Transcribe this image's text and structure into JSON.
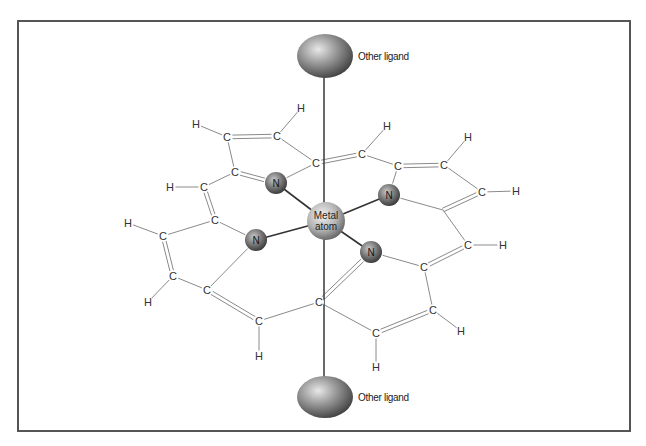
{
  "diagram": {
    "frame": {
      "x1": 18,
      "y1": 21,
      "x2": 630,
      "y2": 431,
      "color": "#555555"
    },
    "colors": {
      "bond": "#8a8a8a",
      "axis": "#444444",
      "metal_bond": "#333333",
      "sphere_light": "#e8e8e8",
      "sphere_dark": "#4a4a4a"
    },
    "axis": {
      "x": 324,
      "y1": 60,
      "y2": 395
    },
    "ligands": [
      {
        "id": "top",
        "cx": 325,
        "cy": 56,
        "rx": 28,
        "ry": 22,
        "label": "Other ligand",
        "label_x": 358,
        "label_y": 60
      },
      {
        "id": "bottom",
        "cx": 325,
        "cy": 397,
        "rx": 28,
        "ry": 21,
        "label": "Other ligand",
        "label_x": 358,
        "label_y": 401
      }
    ],
    "metal": {
      "cx": 326,
      "cy": 221,
      "r": 19,
      "label_line1": "Metal",
      "label_line2": "atom"
    },
    "nitrogens": [
      {
        "id": "N1",
        "cx": 276,
        "cy": 183,
        "r": 11,
        "label": "N"
      },
      {
        "id": "N2",
        "cx": 389,
        "cy": 195,
        "r": 11,
        "label": "N"
      },
      {
        "id": "N3",
        "cx": 256,
        "cy": 240,
        "r": 11,
        "label": "N"
      },
      {
        "id": "N4",
        "cx": 371,
        "cy": 252,
        "r": 11,
        "label": "N"
      }
    ],
    "atoms": [
      {
        "id": "H1",
        "x": 196,
        "y": 124,
        "label": "H"
      },
      {
        "id": "C1",
        "x": 227,
        "y": 137,
        "label": "C"
      },
      {
        "id": "C2",
        "x": 277,
        "y": 136,
        "label": "C"
      },
      {
        "id": "H2",
        "x": 301,
        "y": 108,
        "label": "H"
      },
      {
        "id": "C3",
        "x": 316,
        "y": 163,
        "label": "C"
      },
      {
        "id": "C4",
        "x": 235,
        "y": 172,
        "label": "C"
      },
      {
        "id": "H3",
        "x": 170,
        "y": 187,
        "label": "H"
      },
      {
        "id": "C5",
        "x": 204,
        "y": 187,
        "label": "C"
      },
      {
        "id": "C6",
        "x": 215,
        "y": 220,
        "label": "C"
      },
      {
        "id": "H4",
        "x": 128,
        "y": 223,
        "label": "H"
      },
      {
        "id": "C7",
        "x": 163,
        "y": 236,
        "label": "C"
      },
      {
        "id": "C8",
        "x": 173,
        "y": 276,
        "label": "C"
      },
      {
        "id": "H5",
        "x": 148,
        "y": 302,
        "label": "H"
      },
      {
        "id": "C9",
        "x": 207,
        "y": 290,
        "label": "C"
      },
      {
        "id": "C10",
        "x": 259,
        "y": 321,
        "label": "C"
      },
      {
        "id": "H6",
        "x": 259,
        "y": 356,
        "label": "H"
      },
      {
        "id": "C11",
        "x": 319,
        "y": 302,
        "label": "C"
      },
      {
        "id": "C12",
        "x": 376,
        "y": 333,
        "label": "C"
      },
      {
        "id": "H7",
        "x": 376,
        "y": 367,
        "label": "H"
      },
      {
        "id": "C13",
        "x": 433,
        "y": 310,
        "label": "C"
      },
      {
        "id": "H8",
        "x": 461,
        "y": 331,
        "label": "H"
      },
      {
        "id": "C14",
        "x": 424,
        "y": 267,
        "label": "C"
      },
      {
        "id": "C15",
        "x": 468,
        "y": 245,
        "label": "C"
      },
      {
        "id": "H9",
        "x": 503,
        "y": 245,
        "label": "H"
      },
      {
        "id": "C16",
        "x": 482,
        "y": 192,
        "label": "C"
      },
      {
        "id": "H10",
        "x": 516,
        "y": 191,
        "label": "H"
      },
      {
        "id": "C17",
        "x": 444,
        "y": 165,
        "label": "C"
      },
      {
        "id": "H11",
        "x": 468,
        "y": 137,
        "label": "H"
      },
      {
        "id": "C18",
        "x": 398,
        "y": 166,
        "label": "C"
      },
      {
        "id": "C19",
        "x": 362,
        "y": 154,
        "label": "C"
      },
      {
        "id": "H12",
        "x": 387,
        "y": 126,
        "label": "H"
      }
    ],
    "junctions": [
      {
        "id": "J1",
        "x": 443,
        "y": 210
      }
    ],
    "bonds": [
      {
        "a": "H1",
        "b": "C1",
        "order": 1
      },
      {
        "a": "C1",
        "b": "C2",
        "order": 2
      },
      {
        "a": "C2",
        "b": "H2",
        "order": 1
      },
      {
        "a": "C2",
        "b": "C3",
        "order": 1
      },
      {
        "a": "C1",
        "b": "C4",
        "order": 1
      },
      {
        "a": "C4",
        "b": "N1",
        "order": 2
      },
      {
        "a": "N1",
        "b": "C3",
        "order": 1
      },
      {
        "a": "C3",
        "b": "C19",
        "order": 2
      },
      {
        "a": "C19",
        "b": "H12",
        "order": 1
      },
      {
        "a": "C19",
        "b": "C18",
        "order": 1
      },
      {
        "a": "C18",
        "b": "C17",
        "order": 2
      },
      {
        "a": "C17",
        "b": "H11",
        "order": 1
      },
      {
        "a": "C17",
        "b": "C16",
        "order": 1
      },
      {
        "a": "C16",
        "b": "H10",
        "order": 1
      },
      {
        "a": "C16",
        "b": "J1",
        "order": 2
      },
      {
        "a": "C18",
        "b": "N2",
        "order": 1
      },
      {
        "a": "N2",
        "b": "J1",
        "order": 1
      },
      {
        "a": "J1",
        "b": "C15",
        "order": 1
      },
      {
        "a": "C15",
        "b": "H9",
        "order": 1
      },
      {
        "a": "C15",
        "b": "C14",
        "order": 2
      },
      {
        "a": "C14",
        "b": "N4",
        "order": 1
      },
      {
        "a": "C14",
        "b": "C13",
        "order": 1
      },
      {
        "a": "C13",
        "b": "H8",
        "order": 1
      },
      {
        "a": "C13",
        "b": "C12",
        "order": 2
      },
      {
        "a": "C12",
        "b": "H7",
        "order": 1
      },
      {
        "a": "C12",
        "b": "C11",
        "order": 1
      },
      {
        "a": "C11",
        "b": "N4",
        "order": 2
      },
      {
        "a": "C11",
        "b": "C10",
        "order": 1
      },
      {
        "a": "C10",
        "b": "H6",
        "order": 1
      },
      {
        "a": "C10",
        "b": "C9",
        "order": 2
      },
      {
        "a": "C9",
        "b": "N3",
        "order": 1
      },
      {
        "a": "C9",
        "b": "C8",
        "order": 1
      },
      {
        "a": "C8",
        "b": "H5",
        "order": 1
      },
      {
        "a": "C8",
        "b": "C7",
        "order": 2
      },
      {
        "a": "C7",
        "b": "H4",
        "order": 1
      },
      {
        "a": "C7",
        "b": "C6",
        "order": 1
      },
      {
        "a": "C6",
        "b": "N3",
        "order": 1
      },
      {
        "a": "C6",
        "b": "C5",
        "order": 2
      },
      {
        "a": "C5",
        "b": "H3",
        "order": 1
      },
      {
        "a": "C5",
        "b": "C4",
        "order": 1
      }
    ],
    "metal_bonds": [
      "N1",
      "N2",
      "N3",
      "N4"
    ]
  }
}
